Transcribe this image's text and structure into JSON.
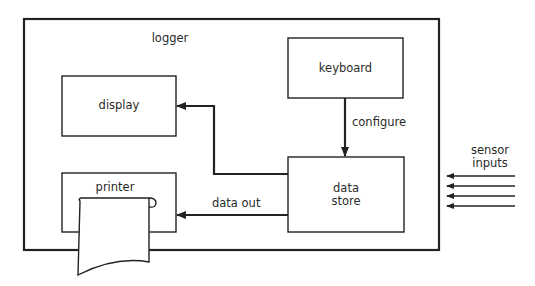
{
  "diagram": {
    "container": {
      "label": "logger"
    },
    "blocks": {
      "keyboard": {
        "label": "keyboard"
      },
      "display": {
        "label": "display"
      },
      "printer": {
        "label": "printer"
      },
      "data_store": {
        "label_line1": "data",
        "label_line2": "store"
      }
    },
    "edges": {
      "configure": {
        "label": "configure",
        "from": "keyboard",
        "to": "data store"
      },
      "to_display": {
        "from": "data store",
        "to": "display"
      },
      "data_out": {
        "label": "data out",
        "from": "data store",
        "to": "printer"
      },
      "sensor_inputs": {
        "label_line1": "sensor",
        "label_line2": "inputs",
        "count": 4,
        "to": "logger"
      }
    },
    "colors": {
      "stroke": "#222222",
      "background": "#ffffff"
    }
  }
}
